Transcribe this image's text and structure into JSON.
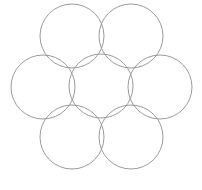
{
  "canvas": {
    "width": 202,
    "height": 190,
    "background_color": "#ffffff",
    "title": "Seven overlapping circles in hexagonal rosette arrangement"
  },
  "style": {
    "stroke_color": "#8e8e8e",
    "stroke_width": 0.9,
    "fill": "none"
  },
  "figure": {
    "shape_type": "circle",
    "count": 7,
    "arrangement": "hexagonal-rosette",
    "radius": 32,
    "circles": [
      {
        "id": "circle-center",
        "label": "center circle",
        "cx": 101,
        "cy": 86,
        "r": 32
      },
      {
        "id": "circle-top-left",
        "label": "top left circle",
        "cx": 72,
        "cy": 36,
        "r": 32
      },
      {
        "id": "circle-top-right",
        "label": "top right circle",
        "cx": 131,
        "cy": 36,
        "r": 32
      },
      {
        "id": "circle-left",
        "label": "left circle",
        "cx": 43,
        "cy": 87,
        "r": 32
      },
      {
        "id": "circle-right",
        "label": "right circle",
        "cx": 160,
        "cy": 87,
        "r": 32
      },
      {
        "id": "circle-bottom-left",
        "label": "bottom left circle",
        "cx": 72,
        "cy": 137,
        "r": 32
      },
      {
        "id": "circle-bottom-right",
        "label": "bottom right circle",
        "cx": 131,
        "cy": 137,
        "r": 32
      }
    ]
  }
}
